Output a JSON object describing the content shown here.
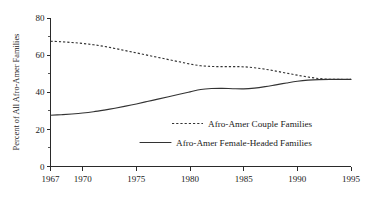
{
  "chart_data": {
    "type": "line",
    "title": "",
    "xlabel": "",
    "ylabel": "Percent of All Afro-Amer Families",
    "xlim": [
      1967,
      1995
    ],
    "ylim": [
      0,
      80
    ],
    "yticks": [
      0,
      20,
      40,
      60,
      80
    ],
    "ytick_labels": [
      "0",
      "20",
      "40",
      "60",
      "80"
    ],
    "yticks_minor": [
      10,
      30,
      50,
      70
    ],
    "xticks": [
      1967,
      1970,
      1975,
      1980,
      1985,
      1990,
      1995
    ],
    "xtick_labels": [
      "1967",
      "1970",
      "1975",
      "1980",
      "1985",
      "1990",
      "1995"
    ],
    "grid": false,
    "legend_position": "center-right-inside",
    "x": [
      1967,
      1968,
      1969,
      1970,
      1971,
      1972,
      1973,
      1974,
      1975,
      1976,
      1977,
      1978,
      1979,
      1980,
      1981,
      1982,
      1983,
      1984,
      1985,
      1986,
      1987,
      1988,
      1989,
      1990,
      1991,
      1992,
      1993,
      1994,
      1995
    ],
    "series": [
      {
        "name": "Afro-Amer Couple Families",
        "style": "dashed",
        "color": "#333333",
        "values": [
          67.5,
          67.2,
          66.8,
          66.3,
          65.6,
          64.7,
          63.6,
          62.4,
          61.2,
          60.0,
          58.8,
          57.6,
          56.4,
          55.2,
          54.3,
          53.9,
          53.8,
          53.8,
          53.7,
          53.2,
          52.4,
          51.4,
          50.3,
          49.2,
          48.2,
          47.4,
          47.0,
          46.9,
          46.9
        ]
      },
      {
        "name": "Afro-Amer Female-Headed Families",
        "style": "solid",
        "color": "#333333",
        "values": [
          27.6,
          27.9,
          28.3,
          28.8,
          29.5,
          30.4,
          31.4,
          32.5,
          33.7,
          35.0,
          36.3,
          37.6,
          38.9,
          40.2,
          41.5,
          42.0,
          42.1,
          41.9,
          41.8,
          42.2,
          43.0,
          44.0,
          45.0,
          45.9,
          46.5,
          46.8,
          46.9,
          46.9,
          46.9
        ]
      }
    ],
    "legend": [
      {
        "label": "Afro-Amer Couple Families",
        "style": "dashed"
      },
      {
        "label": "Afro-Amer Female-Headed Families",
        "style": "solid"
      }
    ]
  }
}
